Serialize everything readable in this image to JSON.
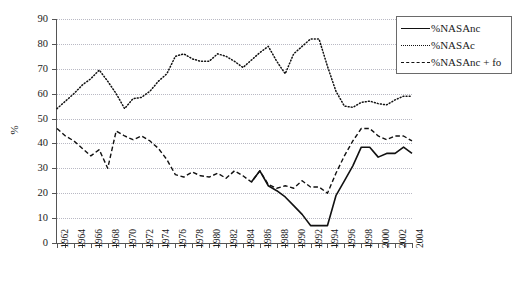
{
  "chart_data": {
    "type": "line",
    "title": "",
    "xlabel": "",
    "ylabel": "%",
    "xlim": [
      1962,
      2004
    ],
    "ylim": [
      0,
      90
    ],
    "ytick_step": 10,
    "yticks": [
      0,
      10,
      20,
      30,
      40,
      50,
      60,
      70,
      80,
      90
    ],
    "xticks": [
      1962,
      1964,
      1966,
      1968,
      1970,
      1972,
      1974,
      1976,
      1978,
      1980,
      1982,
      1984,
      1986,
      1988,
      1990,
      1992,
      1994,
      1996,
      1998,
      2000,
      2002,
      2004
    ],
    "x": [
      1962,
      1963,
      1964,
      1965,
      1966,
      1967,
      1968,
      1969,
      1970,
      1971,
      1972,
      1973,
      1974,
      1975,
      1976,
      1977,
      1978,
      1979,
      1980,
      1981,
      1982,
      1983,
      1984,
      1985,
      1986,
      1987,
      1988,
      1989,
      1990,
      1991,
      1992,
      1993,
      1994,
      1995,
      1996,
      1997,
      1998,
      1999,
      2000,
      2001,
      2002,
      2003,
      2004
    ],
    "grid": true,
    "legend_position": "top-right",
    "series": [
      {
        "name": "%NASAnc",
        "style": "solid",
        "color": "#111111",
        "x": [
          1985,
          1986,
          1987,
          1988,
          1989,
          1990,
          1991,
          1992,
          1993,
          1994,
          1995,
          1996,
          1997,
          1998,
          1999,
          2000,
          2001,
          2002,
          2003,
          2004
        ],
        "values": [
          24.5,
          29.0,
          23.0,
          21.0,
          18.5,
          15.0,
          11.5,
          7.0,
          7.0,
          7.0,
          19.0,
          25.0,
          31.0,
          38.5,
          38.5,
          34.5,
          36.0,
          36.0,
          38.5,
          36.0
        ]
      },
      {
        "name": "%NASAc",
        "style": "dotted",
        "color": "#111111",
        "x": [
          1962,
          1963,
          1964,
          1965,
          1966,
          1967,
          1968,
          1969,
          1970,
          1971,
          1972,
          1973,
          1974,
          1975,
          1976,
          1977,
          1978,
          1979,
          1980,
          1981,
          1982,
          1983,
          1984,
          1985,
          1986,
          1987,
          1988,
          1989,
          1990,
          1991,
          1992,
          1993,
          1994,
          1995,
          1996,
          1997,
          1998,
          1999,
          2000,
          2001,
          2002,
          2003,
          2004
        ],
        "values": [
          54.0,
          57.0,
          60.0,
          63.5,
          66.0,
          69.5,
          65.0,
          60.0,
          54.0,
          58.0,
          58.5,
          61.0,
          65.0,
          68.0,
          75.0,
          76.0,
          74.0,
          73.0,
          73.0,
          76.0,
          75.0,
          73.0,
          70.5,
          73.5,
          76.5,
          79.0,
          73.0,
          68.0,
          76.0,
          79.0,
          82.0,
          82.0,
          71.0,
          61.0,
          55.0,
          54.5,
          56.5,
          57.0,
          56.0,
          55.5,
          57.5,
          59.0,
          59.0
        ]
      },
      {
        "name": "%NASAnc + fo",
        "style": "dashed",
        "color": "#111111",
        "x": [
          1962,
          1963,
          1964,
          1965,
          1966,
          1967,
          1968,
          1969,
          1970,
          1971,
          1972,
          1973,
          1974,
          1975,
          1976,
          1977,
          1978,
          1979,
          1980,
          1981,
          1982,
          1983,
          1984,
          1985,
          1986,
          1987,
          1988,
          1989,
          1990,
          1991,
          1992,
          1993,
          1994,
          1995,
          1996,
          1997,
          1998,
          1999,
          2000,
          2001,
          2002,
          2003,
          2004
        ],
        "values": [
          46.0,
          43.0,
          41.0,
          38.0,
          35.0,
          37.5,
          30.0,
          45.0,
          43.0,
          41.5,
          43.0,
          41.0,
          38.0,
          33.5,
          27.5,
          26.5,
          28.5,
          27.0,
          26.5,
          28.0,
          26.0,
          29.0,
          27.0,
          24.5,
          29.0,
          23.5,
          22.0,
          23.0,
          22.0,
          25.0,
          22.5,
          22.5,
          20.0,
          28.0,
          35.0,
          41.0,
          46.0,
          46.0,
          43.0,
          41.5,
          43.0,
          43.0,
          41.0
        ]
      }
    ]
  },
  "legend": {
    "items": [
      {
        "label": "%NASAnc",
        "style": "solid"
      },
      {
        "label": "%NASAc",
        "style": "dotted"
      },
      {
        "label": "%NASAnc + fo",
        "style": "dashed"
      }
    ]
  },
  "axes": {
    "y_title": "%"
  }
}
